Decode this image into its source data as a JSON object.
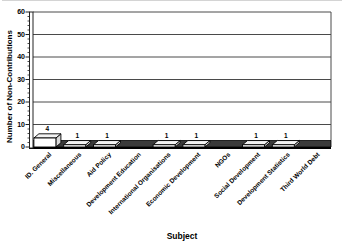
{
  "chart_data": {
    "type": "bar",
    "style": "3d-column-white-bars-black-outline",
    "title": "",
    "xlabel": "Subject",
    "ylabel": "Number of Non-Contributions",
    "categories": [
      "ID. General",
      "Miscellaneous",
      "Aid Policy",
      "Development Education",
      "International Organisations",
      "Economic Development",
      "NGOs",
      "Social Development",
      "Development Statistics",
      "Third World Debt"
    ],
    "values": [
      4,
      1,
      1,
      0,
      1,
      1,
      0,
      1,
      1,
      0
    ],
    "data_labels": [
      "4",
      "1",
      "1",
      "",
      "1",
      "1",
      "",
      "1",
      "1",
      ""
    ],
    "ylim": [
      0,
      60
    ],
    "yticks": [
      0,
      10,
      20,
      30,
      40,
      50,
      60
    ],
    "minor_tick_step": 2,
    "grid": true,
    "legend": "none",
    "colors": {
      "bar_front": "#ffffff",
      "bar_top": "#f2f2f2",
      "bar_side": "#d9d9d9",
      "outline": "#000000",
      "gridline": "#4a4a4a",
      "floor": "#3a3a3a",
      "wall": "#ffffff",
      "text": "#000000"
    }
  }
}
